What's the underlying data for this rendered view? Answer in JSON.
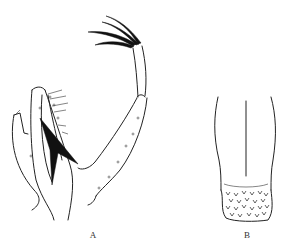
{
  "figure": {
    "panels": [
      {
        "id": "A",
        "label": "A",
        "subject": "appendage with claws and toothed process"
      },
      {
        "id": "B",
        "label": "B",
        "subject": "structure with spinulose distal region"
      }
    ]
  }
}
